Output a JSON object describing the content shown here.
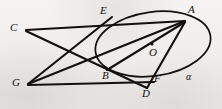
{
  "figure": {
    "type": "euclidean-geometry-diagram",
    "background_color": "#f1f0ee",
    "stroke_color": "#121110",
    "canvas": {
      "width": 222,
      "height": 109
    },
    "conic": {
      "name": "alpha",
      "label": "α",
      "center": {
        "x": 153,
        "y": 44
      },
      "radius_x": 58,
      "radius_y": 32,
      "rotation_deg": -8
    },
    "center_dot": {
      "label": "O",
      "x": 152,
      "y": 44
    },
    "points": [
      {
        "id": "A",
        "label": "A",
        "x": 185,
        "y": 21,
        "label_x": 188,
        "label_y": 6
      },
      {
        "id": "E",
        "label": "E",
        "x": 111,
        "y": 19,
        "label_x": 100,
        "label_y": 7
      },
      {
        "id": "C",
        "label": "C",
        "x": 26,
        "y": 30,
        "label_x": 11,
        "label_y": 22
      },
      {
        "id": "G",
        "label": "G",
        "x": 28,
        "y": 84,
        "label_x": 13,
        "label_y": 77
      },
      {
        "id": "B",
        "label": "B",
        "x": 116,
        "y": 74,
        "label_x": 103,
        "label_y": 71
      },
      {
        "id": "O",
        "label": "O",
        "x": 152,
        "y": 44,
        "label_x": 149,
        "label_y": 47
      },
      {
        "id": "F",
        "label": "F",
        "x": 152,
        "y": 83,
        "label_x": 153,
        "label_y": 74
      },
      {
        "id": "D",
        "label": "D",
        "x": 147,
        "y": 88,
        "label_x": 142,
        "label_y": 88
      },
      {
        "id": "alpha",
        "label": "α",
        "x": 190,
        "y": 79,
        "label_x": 186,
        "label_y": 73
      }
    ],
    "segments": [
      {
        "name": "C-A",
        "from": "C",
        "to": "A"
      },
      {
        "name": "C-D",
        "from": "C",
        "to": "D"
      },
      {
        "name": "G-A",
        "from": "G",
        "to": "A"
      },
      {
        "name": "G-E",
        "from": "G",
        "to": "E"
      },
      {
        "name": "G-F",
        "from": "G",
        "to": "F"
      },
      {
        "name": "A-G-chord",
        "from": "A",
        "to": "G"
      },
      {
        "name": "A-D",
        "from": "A",
        "to": "D"
      },
      {
        "name": "A-B",
        "from": "A",
        "to": "B"
      }
    ]
  }
}
